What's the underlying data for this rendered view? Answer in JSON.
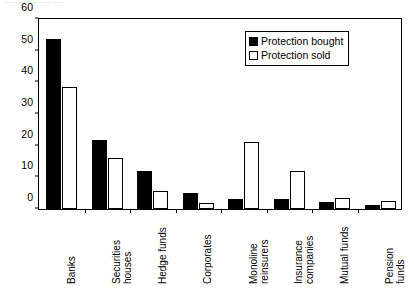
{
  "caption": "...........  ....  ..... .....",
  "legend": {
    "position": "top-right",
    "entries": [
      {
        "label": "Protection bought",
        "swatch": "filled-black-square"
      },
      {
        "label": "Protection sold",
        "swatch": "open-white-square"
      }
    ]
  },
  "chart_data": {
    "type": "bar",
    "title": "",
    "xlabel": "",
    "ylabel": "",
    "ylim": [
      0,
      60
    ],
    "yticks": [
      0,
      10,
      20,
      30,
      40,
      50,
      60
    ],
    "grid": false,
    "legend_position": "top-right",
    "categories": [
      "Banks",
      "Securities houses",
      "Hedge funds",
      "Corporates",
      "Monoline reinsurers",
      "Insurance companies",
      "Mutual funds",
      "Pension funds"
    ],
    "series": [
      {
        "name": "Protection bought",
        "color": "#000000",
        "values": [
          53,
          21.5,
          12,
          5,
          3,
          3,
          2.2,
          1.2
        ]
      },
      {
        "name": "Protection sold",
        "color": "#ffffff",
        "values": [
          38,
          16,
          5.5,
          2,
          21,
          12,
          3.5,
          2.5
        ]
      }
    ]
  }
}
